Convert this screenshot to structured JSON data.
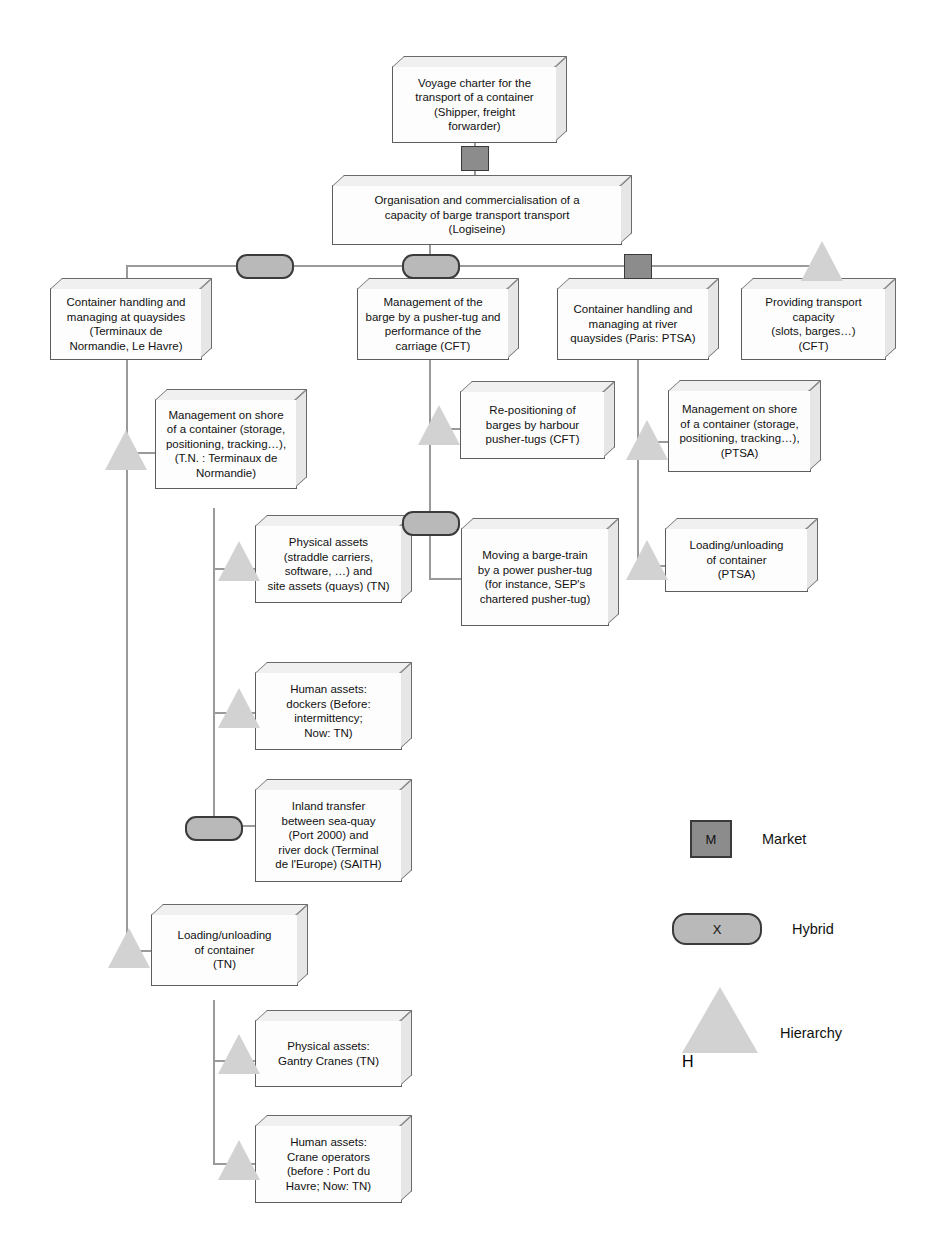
{
  "diagram": {
    "nodes": {
      "voyage_charter": "Voyage charter for the\ntransport of a container\n(Shipper, freight\nforwarder)",
      "organisation": "Organisation and commercialisation of a\ncapacity of barge transport transport\n(Logiseine)",
      "container_handling_quaysides": "Container handling and\nmanaging at quaysides\n(Terminaux de\nNormandie, Le Havre)",
      "management_barge_pushertug": "Management of the\nbarge by a pusher-tug and\nperformance of the\ncarriage (CFT)",
      "container_handling_river": "Container handling and\nmanaging at river\nquaysides (Paris: PTSA)",
      "providing_transport_capacity": "Providing transport\ncapacity\n(slots, barges…)\n(CFT)",
      "management_shore_tn": "Management on shore\nof a container (storage,\npositioning, tracking…),\n(T.N. : Terminaux de\nNormandie)",
      "physical_assets_tn": "Physical assets\n(straddle carriers,\nsoftware, …) and\nsite assets (quays) (TN)",
      "human_assets_dockers": "Human assets:\ndockers (Before:\nintermittency;\nNow: TN)",
      "inland_transfer": "Inland transfer\nbetween sea-quay\n(Port 2000) and\nriver dock (Terminal\nde l'Europe) (SAITH)",
      "loading_unloading_tn": "Loading/unloading\nof container\n(TN)",
      "physical_assets_gantry": "Physical assets:\nGantry Cranes (TN)",
      "human_assets_crane": "Human assets:\nCrane operators\n(before : Port du\nHavre; Now: TN)",
      "repositioning_barges": "Re-positioning of\nbarges by harbour\npusher-tugs (CFT)",
      "moving_barge_train": "Moving a barge-train\nby a power pusher-tug\n(for instance, SEP's\nchartered pusher-tug)",
      "management_shore_ptsa": "Management on shore\nof a container (storage,\npositioning, tracking…),\n(PTSA)",
      "loading_unloading_ptsa": "Loading/unloading\nof container\n(PTSA)"
    },
    "legend": {
      "items": [
        {
          "symbol": "market-square",
          "glyph": "M",
          "label": "Market"
        },
        {
          "symbol": "hybrid-rounded",
          "glyph": "X",
          "label": "Hybrid"
        },
        {
          "symbol": "hierarchy-triangle",
          "glyph": "H",
          "label": "Hierarchy"
        }
      ]
    },
    "colors": {
      "market_fill": "#8c8c8c",
      "hybrid_fill": "#b9b9b9",
      "hierarchy_fill": "#d2d2d2",
      "box_fill": "#fdfdfd",
      "box_border": "#5d5d5d",
      "connector": "#9a9a9a"
    }
  }
}
